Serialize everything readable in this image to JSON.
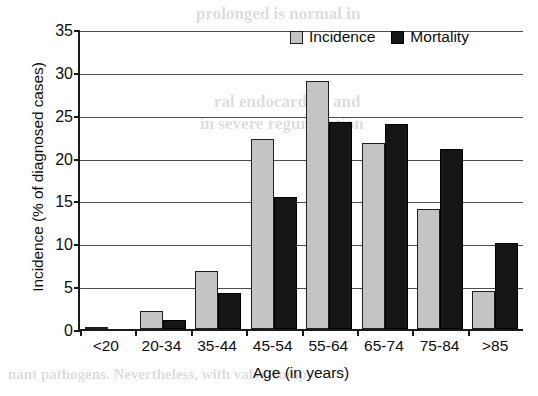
{
  "chart_data": {
    "type": "bar",
    "title": "",
    "xlabel": "Age (in years)",
    "ylabel": "Incidence (% of diagnosed cases)",
    "ylim": [
      0,
      35
    ],
    "yticks": [
      0,
      5,
      10,
      15,
      20,
      25,
      30,
      35
    ],
    "grid": true,
    "legend_position": "top-right",
    "categories": [
      "<20",
      "20-34",
      "35-44",
      "45-54",
      "55-64",
      "65-74",
      "75-84",
      ">85"
    ],
    "series": [
      {
        "name": "Incidence",
        "color": "#c4c4c4",
        "values": [
          0.2,
          2.1,
          6.8,
          22.2,
          28.9,
          21.7,
          14.0,
          4.4
        ]
      },
      {
        "name": "Mortality",
        "color": "#151515",
        "values": [
          0.0,
          1.1,
          4.2,
          15.4,
          24.1,
          23.9,
          21.0,
          10.0
        ]
      }
    ]
  },
  "legend": {
    "items": [
      {
        "label": "Incidence",
        "swatch": "incidence"
      },
      {
        "label": "Mortality",
        "swatch": "mortality"
      }
    ]
  },
  "ghost_text": [
    {
      "text": "prolonged is normal in",
      "x": 196,
      "y": 4,
      "size": 17
    },
    {
      "text": "ral endocarditis and",
      "x": 214,
      "y": 92,
      "size": 17
    },
    {
      "text": "in severe regurgitation",
      "x": 200,
      "y": 114,
      "size": 17
    },
    {
      "text": "2.20",
      "x": 418,
      "y": 238,
      "size": 17
    },
    {
      "text": "nant pathogens. Nevertheless, with valve-comp",
      "x": 8,
      "y": 366,
      "size": 15
    }
  ]
}
